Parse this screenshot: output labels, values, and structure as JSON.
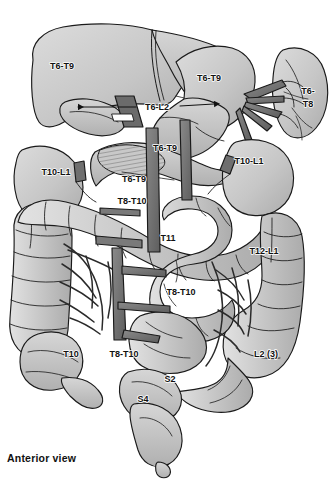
{
  "figure": {
    "caption": "Anterior view",
    "view": "Anterior view",
    "background_color": "#ffffff",
    "palette": {
      "organ_light": "#cfcfcf",
      "organ_mid": "#bdbdbd",
      "organ_dark": "#a6a6a6",
      "vessel_dark": "#6f6f6f",
      "vessel_darker": "#555555",
      "outline": "#1a1a1a",
      "text": "#111111"
    }
  },
  "labels": [
    {
      "id": "liver",
      "text": "T6-T9",
      "x": 62,
      "y": 69,
      "organ": "liver"
    },
    {
      "id": "stomach-upper",
      "text": "T6-T9",
      "x": 209,
      "y": 81,
      "organ": "stomach"
    },
    {
      "id": "spleen-l1",
      "text": "T6-",
      "x": 308,
      "y": 94,
      "organ": "spleen"
    },
    {
      "id": "spleen-l2",
      "text": "T8",
      "x": 308,
      "y": 107,
      "organ": "spleen"
    },
    {
      "id": "gallbladder-bile",
      "text": "T6-L2",
      "x": 157,
      "y": 107,
      "organ": "gallbladder-bile-duct"
    },
    {
      "id": "pancreas-mid",
      "text": "T6-T9",
      "x": 165,
      "y": 151,
      "organ": "pancreas"
    },
    {
      "id": "kidney-left",
      "text": "T10-L1",
      "x": 56,
      "y": 175,
      "organ": "kidney-right"
    },
    {
      "id": "kidney-right",
      "text": "T10-L1",
      "x": 249,
      "y": 164,
      "organ": "kidney-left"
    },
    {
      "id": "stomach-lower",
      "text": "T6-T9",
      "x": 134,
      "y": 182,
      "organ": "stomach-body"
    },
    {
      "id": "duodenum",
      "text": "T8-T10",
      "x": 132,
      "y": 204,
      "organ": "duodenum"
    },
    {
      "id": "small-intestine",
      "text": "T11",
      "x": 168,
      "y": 241,
      "organ": "small-intestine"
    },
    {
      "id": "descending-colon-1",
      "text": "T12-L1",
      "x": 264,
      "y": 254,
      "organ": "descending-colon"
    },
    {
      "id": "jejunum-ileum",
      "text": "T8-T10",
      "x": 181,
      "y": 295,
      "organ": "jejunum-ileum"
    },
    {
      "id": "cecum",
      "text": "T10",
      "x": 71,
      "y": 353,
      "organ": "cecum"
    },
    {
      "id": "ascending-colon",
      "text": "T8-T10",
      "x": 124,
      "y": 354,
      "organ": "ascending-colon"
    },
    {
      "id": "sigmoid-colon",
      "text": "L2 (3)",
      "x": 266,
      "y": 354,
      "organ": "sigmoid-colon"
    },
    {
      "id": "rectum-s2",
      "text": "S2",
      "x": 170,
      "y": 382,
      "organ": "rectum"
    },
    {
      "id": "bladder-s4",
      "text": "S4",
      "x": 143,
      "y": 402,
      "organ": "urinary-bladder"
    }
  ],
  "arrows": [
    {
      "id": "t6l2-left",
      "from_x": 135,
      "from_y": 107,
      "to_x": 76,
      "to_y": 107,
      "head": "left"
    },
    {
      "id": "t6l2-right",
      "from_x": 180,
      "from_y": 106,
      "to_x": 216,
      "to_y": 104,
      "head": "right"
    }
  ]
}
